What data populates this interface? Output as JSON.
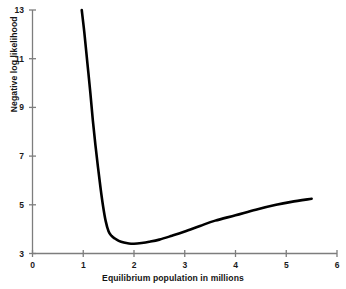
{
  "chart_data": {
    "type": "line",
    "title": "",
    "xlabel": "Equilibrium population in millions",
    "ylabel": "Negative log likelihood",
    "xlim": [
      0,
      6
    ],
    "ylim": [
      3,
      13
    ],
    "xticks": [
      0,
      1,
      2,
      3,
      4,
      5,
      6
    ],
    "xtick_labels": [
      "0",
      "1",
      "2",
      "3",
      "4",
      "5",
      "6"
    ],
    "yticks": [
      3,
      5,
      7,
      9,
      11,
      13
    ],
    "ytick_labels": [
      "3",
      "5",
      "7",
      "9",
      "11",
      "13"
    ],
    "grid": false,
    "legend": null,
    "line_color": "#000000",
    "line_width": 2.6,
    "series": [
      {
        "name": "Negative log likelihood profile",
        "x": [
          0.97,
          1.02,
          1.08,
          1.14,
          1.19,
          1.24,
          1.29,
          1.34,
          1.39,
          1.44,
          1.5,
          1.56,
          1.62,
          1.7,
          1.8,
          1.9,
          2.0,
          2.15,
          2.3,
          2.5,
          2.75,
          3.0,
          3.3,
          3.6,
          4.0,
          4.4,
          4.8,
          5.1,
          5.5
        ],
        "y": [
          13.0,
          12.1,
          10.85,
          9.6,
          8.45,
          7.45,
          6.55,
          5.7,
          4.95,
          4.35,
          3.9,
          3.72,
          3.62,
          3.52,
          3.45,
          3.41,
          3.4,
          3.43,
          3.48,
          3.57,
          3.73,
          3.9,
          4.13,
          4.35,
          4.57,
          4.8,
          5.0,
          5.12,
          5.25
        ]
      }
    ],
    "annotations": {
      "minimum_x": 2.0,
      "minimum_y": 3.4
    }
  },
  "axes": {
    "y_axis_name": "y-axis-line",
    "x_axis_name": "x-axis-line"
  }
}
